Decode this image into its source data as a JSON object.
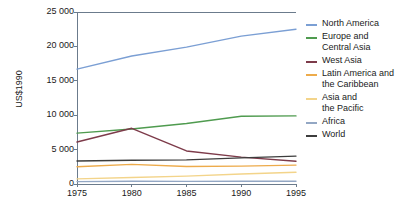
{
  "chart_data": {
    "type": "line",
    "title": "",
    "xlabel": "",
    "ylabel": "US$1990",
    "x": [
      1975,
      1980,
      1985,
      1990,
      1995
    ],
    "xlim": [
      1975,
      1995
    ],
    "ylim": [
      0,
      25000
    ],
    "grid": false,
    "legend_position": "right",
    "x_tick_labels": [
      "1975",
      "1980",
      "1985",
      "1990",
      "1995"
    ],
    "y_tick_labels": [
      "0",
      "5 000",
      "10 000",
      "15 000",
      "20 000",
      "25 000"
    ],
    "y_tick_values": [
      0,
      5000,
      10000,
      15000,
      20000,
      25000
    ],
    "series": [
      {
        "name": "North America",
        "label": "North America",
        "color": "#7b9fd4",
        "values": [
          16700,
          18600,
          19900,
          21500,
          22500
        ]
      },
      {
        "name": "Europe and Central Asia",
        "label": "Europe and\nCentral Asia",
        "color": "#4f9b4f",
        "values": [
          7400,
          8000,
          8800,
          9850,
          9900
        ]
      },
      {
        "name": "West Asia",
        "label": "West Asia",
        "color": "#7d3b4a",
        "values": [
          6100,
          8100,
          4800,
          3900,
          3300
        ]
      },
      {
        "name": "Latin America and the Caribbean",
        "label": "Latin America and\nthe Caribbean",
        "color": "#edab4b",
        "values": [
          2500,
          2850,
          2550,
          2600,
          2750
        ]
      },
      {
        "name": "Asia and the Pacific",
        "label": "Asia and\nthe Pacific",
        "color": "#f3d48a",
        "values": [
          750,
          950,
          1150,
          1450,
          1700
        ]
      },
      {
        "name": "Africa",
        "label": "Africa",
        "color": "#93a7c4",
        "values": [
          350,
          400,
          380,
          390,
          400
        ]
      },
      {
        "name": "World",
        "label": "World",
        "color": "#3d3d3d",
        "values": [
          3350,
          3450,
          3500,
          3800,
          4050
        ]
      }
    ]
  },
  "axes": {
    "y_axis_title": "US$1990"
  },
  "colors": {
    "axis": "#6b7b8c",
    "text": "#1a1a1a",
    "background": "#ffffff"
  }
}
